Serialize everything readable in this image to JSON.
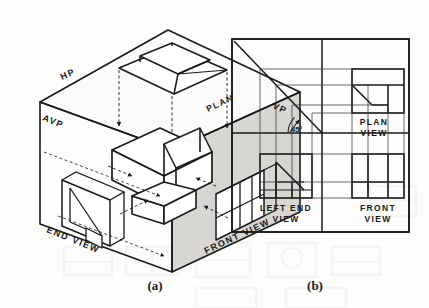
{
  "figure": {
    "type": "engineering-drawing",
    "panels": [
      {
        "id": "a",
        "caption": "(a)",
        "kind": "isometric-projection-box",
        "labels": [
          {
            "text": "HP",
            "meaning": "horizontal-plane"
          },
          {
            "text": "AVP",
            "meaning": "auxiliary-vertical-plane"
          },
          {
            "text": "VP",
            "meaning": "vertical-plane"
          },
          {
            "text": "PLAN",
            "meaning": "plan-projection"
          },
          {
            "text": "END VIEW",
            "meaning": "end-view-projection"
          },
          {
            "text": "FRONT VIEW",
            "meaning": "front-view-projection"
          }
        ]
      },
      {
        "id": "b",
        "caption": "(b)",
        "kind": "multiview-layout",
        "angle_annotation": "45°",
        "labels": [
          {
            "text": "PLAN\nVIEW",
            "line1": "PLAN",
            "line2": "VIEW"
          },
          {
            "text": "LEFT END\nVIEW",
            "line1": "LEFT END",
            "line2": "VIEW"
          },
          {
            "text": "FRONT\nVIEW",
            "line1": "FRONT",
            "line2": "VIEW"
          }
        ]
      }
    ]
  },
  "panel_a": {
    "label_hp": "HP",
    "label_avp": "AVP",
    "label_vp": "VP",
    "label_plan": "PLAN",
    "label_end_view": "END VIEW",
    "label_front_view": "FRONT VIEW",
    "caption": "(a)"
  },
  "panel_b": {
    "label_angle": "45°",
    "plan_line1": "PLAN",
    "plan_line2": "VIEW",
    "left_end_line1": "LEFT END",
    "left_end_line2": "VIEW",
    "front_line1": "FRONT",
    "front_line2": "VIEW",
    "caption": "(b)"
  },
  "colors": {
    "ink": "#1a1a1a",
    "paper": "#fdfdfc",
    "shaded_plane": "#d8d6d2",
    "thin_line": "#2a2a2a",
    "bleed": "#ececea"
  }
}
